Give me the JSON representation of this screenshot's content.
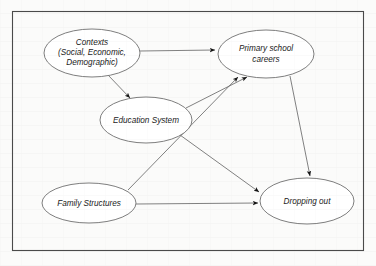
{
  "figure": {
    "kind": "conceptual-causal-diagram",
    "frame": {
      "visible": true,
      "color": "#4a4a4a"
    },
    "background_color": "#fbfbfa",
    "node_fill": "#ffffff",
    "node_stroke": "#6f6f6f",
    "edge_color": "#6a6a6a",
    "arrowhead_color": "#141414"
  },
  "nodes": [
    {
      "id": "contexts",
      "label_lines": [
        "Contexts",
        "(Social, Economic,",
        "Demographic)"
      ],
      "label": "Contexts (Social, Economic, Demographic)",
      "cx": 92,
      "cy": 53,
      "rx": 48,
      "ry": 24
    },
    {
      "id": "primary_school_careers",
      "label_lines": [
        "Primary school",
        "careers"
      ],
      "label": "Primary school careers",
      "cx": 266,
      "cy": 54,
      "rx": 48,
      "ry": 24
    },
    {
      "id": "education_system",
      "label_lines": [
        "Education System"
      ],
      "label": "Education System",
      "cx": 146,
      "cy": 120,
      "rx": 46,
      "ry": 23
    },
    {
      "id": "family_structures",
      "label_lines": [
        "Family Structures"
      ],
      "label": "Family Structures",
      "cx": 89,
      "cy": 203,
      "rx": 47,
      "ry": 20
    },
    {
      "id": "dropping_out",
      "label_lines": [
        "Dropping out"
      ],
      "label": "Dropping out",
      "cx": 307,
      "cy": 201,
      "rx": 47,
      "ry": 23
    }
  ],
  "edges": [
    {
      "id": "contexts-to-primary",
      "from": "contexts",
      "to": "primary_school_careers",
      "directed": true
    },
    {
      "id": "contexts-to-education",
      "from": "contexts",
      "to": "education_system",
      "directed": true
    },
    {
      "id": "education-to-primary",
      "from": "education_system",
      "to": "primary_school_careers",
      "directed": true
    },
    {
      "id": "education-to-dropping",
      "from": "education_system",
      "to": "dropping_out",
      "directed": true
    },
    {
      "id": "family-to-primary",
      "from": "family_structures",
      "to": "primary_school_careers",
      "directed": true
    },
    {
      "id": "family-to-dropping",
      "from": "family_structures",
      "to": "dropping_out",
      "directed": true
    },
    {
      "id": "primary-to-dropping",
      "from": "primary_school_careers",
      "to": "dropping_out",
      "directed": true
    }
  ]
}
